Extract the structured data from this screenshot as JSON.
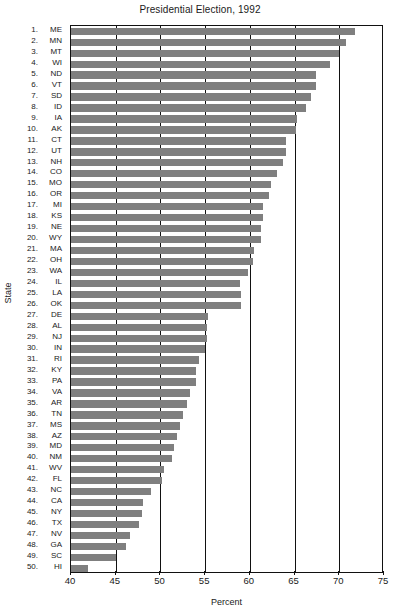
{
  "chart_data": {
    "type": "bar",
    "orientation": "horizontal",
    "title": "Presidential Election, 1992",
    "xlabel": "Percent",
    "ylabel": "State",
    "xlim": [
      40,
      75
    ],
    "xticks": [
      40,
      45,
      50,
      55,
      60,
      65,
      70,
      75
    ],
    "grid": true,
    "grid_axis": "x",
    "legend": null,
    "bar_color": "#7f7f7f",
    "axis_color": "#111111",
    "categories": [
      "ME",
      "MN",
      "MT",
      "WI",
      "ND",
      "VT",
      "SD",
      "ID",
      "IA",
      "AK",
      "CT",
      "UT",
      "NH",
      "CO",
      "MO",
      "OR",
      "MI",
      "KS",
      "NE",
      "WY",
      "MA",
      "OH",
      "WA",
      "IL",
      "LA",
      "OK",
      "DE",
      "AL",
      "NJ",
      "IN",
      "RI",
      "KY",
      "PA",
      "VA",
      "AR",
      "TN",
      "MS",
      "AZ",
      "MD",
      "NM",
      "WV",
      "FL",
      "NC",
      "CA",
      "NY",
      "TX",
      "NV",
      "GA",
      "SC",
      "HI"
    ],
    "ranks": [
      1,
      2,
      3,
      4,
      5,
      6,
      7,
      8,
      9,
      10,
      11,
      12,
      13,
      14,
      15,
      16,
      17,
      18,
      19,
      20,
      21,
      22,
      23,
      24,
      25,
      26,
      27,
      28,
      29,
      30,
      31,
      32,
      33,
      34,
      35,
      36,
      37,
      38,
      39,
      40,
      41,
      42,
      43,
      44,
      45,
      46,
      47,
      48,
      49,
      50
    ],
    "values": [
      71.8,
      70.8,
      70.0,
      69.0,
      67.4,
      67.4,
      66.8,
      66.3,
      65.3,
      65.2,
      64.0,
      64.0,
      63.7,
      63.0,
      62.4,
      62.1,
      61.5,
      61.5,
      61.3,
      61.2,
      60.5,
      60.4,
      59.8,
      58.9,
      59.0,
      59.0,
      55.3,
      55.2,
      55.2,
      55.0,
      54.3,
      54.0,
      54.0,
      53.3,
      53.0,
      52.5,
      52.2,
      51.9,
      51.5,
      51.3,
      50.4,
      50.2,
      49.0,
      48.0,
      47.9,
      47.6,
      46.6,
      46.1,
      45.0,
      41.9
    ],
    "value_unit": "percent",
    "n_categories": 50
  },
  "axis": {
    "tick_labels": [
      "40",
      "45",
      "50",
      "55",
      "60",
      "65",
      "70",
      "75"
    ]
  }
}
